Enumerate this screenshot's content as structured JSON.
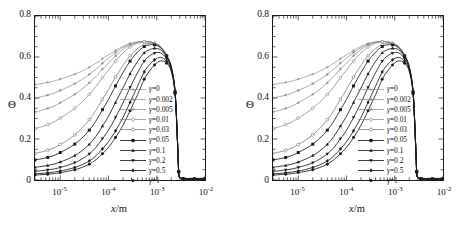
{
  "figure": {
    "panel_count": 2,
    "background": "#ffffff",
    "ink_color": "#1a1a1a"
  },
  "axes": {
    "ylabel": "Θ",
    "xlabel_var": "x",
    "xlabel_unit": "m",
    "xlabel": "x/m",
    "yticks": [
      "0",
      "0.2",
      "0.4",
      "0.6",
      "0.8"
    ],
    "ytick_values": [
      0,
      0.2,
      0.4,
      0.6,
      0.8
    ],
    "xticks": [
      "10⁻⁵",
      "10⁻⁴",
      "10⁻³",
      "10⁻²"
    ],
    "xtick_mantissa": "10",
    "xtick_exponents": [
      "-5",
      "-4",
      "-3",
      "-2"
    ],
    "xtick_values": [
      1e-05,
      0.0001,
      0.001,
      0.01
    ],
    "ylim": [
      0,
      0.8
    ],
    "xlim": [
      3e-06,
      0.01
    ],
    "xscale": "log",
    "yscale": "linear",
    "grid": "off"
  },
  "legend": {
    "position": "center-right-inside",
    "entries": [
      {
        "label": "γ=0",
        "gamma": 0,
        "marker": "plus",
        "color": "#8d8d8d"
      },
      {
        "label": "γ=0.002",
        "gamma": 0.002,
        "marker": "star",
        "color": "#8a8a8a"
      },
      {
        "label": "γ=0.005",
        "gamma": 0.005,
        "marker": "asterisk",
        "color": "#848484"
      },
      {
        "label": "γ=0.01",
        "gamma": 0.01,
        "marker": "circle-open",
        "color": "#7c7c7c"
      },
      {
        "label": "γ=0.03",
        "gamma": 0.03,
        "marker": "circle-open",
        "color": "#6e6e6e"
      },
      {
        "label": "γ=0.05",
        "gamma": 0.05,
        "marker": "square-filled",
        "color": "#1a1a1a"
      },
      {
        "label": "γ=0.1",
        "gamma": 0.1,
        "marker": "triangle-up",
        "color": "#1a1a1a"
      },
      {
        "label": "γ=0.2",
        "gamma": 0.2,
        "marker": "triangle-down",
        "color": "#1a1a1a"
      },
      {
        "label": "γ=0.5",
        "gamma": 0.5,
        "marker": "diamond",
        "color": "#1a1a1a"
      },
      {
        "label": "γ=1",
        "gamma": 1,
        "marker": "circle-filled",
        "color": "#1a1a1a"
      }
    ]
  },
  "chart_data": {
    "type": "line",
    "title": "",
    "xlabel": "x/m",
    "ylabel": "Θ",
    "xscale": "log",
    "xlim": [
      3e-06,
      0.01
    ],
    "ylim": [
      0,
      0.8
    ],
    "grid": "off",
    "legend_position": "center-right-inside",
    "x": [
      3e-06,
      4e-06,
      5.5e-06,
      7.5e-06,
      1e-05,
      1.4e-05,
      2e-05,
      2.8e-05,
      4e-05,
      5.5e-05,
      7.5e-05,
      0.0001,
      0.00014,
      0.0002,
      0.00028,
      0.0004,
      0.00055,
      0.0007,
      0.0009,
      0.0012,
      0.0016,
      0.002,
      0.0024,
      0.0027,
      0.00285,
      0.003,
      0.0035,
      0.0045,
      0.006,
      0.008,
      0.01
    ],
    "series": [
      {
        "name": "γ=0",
        "values": [
          0.465,
          0.47,
          0.476,
          0.483,
          0.492,
          0.503,
          0.516,
          0.531,
          0.55,
          0.57,
          0.592,
          0.61,
          0.632,
          0.652,
          0.666,
          0.674,
          0.676,
          0.674,
          0.667,
          0.65,
          0.608,
          0.552,
          0.43,
          0.18,
          0.04,
          0.012,
          0.006,
          0.005,
          0.005,
          0.005,
          0.005
        ]
      },
      {
        "name": "γ=0.002",
        "values": [
          0.4,
          0.406,
          0.414,
          0.424,
          0.437,
          0.452,
          0.47,
          0.49,
          0.515,
          0.541,
          0.57,
          0.594,
          0.622,
          0.646,
          0.663,
          0.673,
          0.676,
          0.674,
          0.667,
          0.65,
          0.608,
          0.552,
          0.43,
          0.18,
          0.04,
          0.012,
          0.006,
          0.005,
          0.005,
          0.005,
          0.005
        ]
      },
      {
        "name": "γ=0.005",
        "values": [
          0.332,
          0.339,
          0.349,
          0.361,
          0.377,
          0.396,
          0.418,
          0.443,
          0.474,
          0.506,
          0.541,
          0.571,
          0.606,
          0.637,
          0.658,
          0.671,
          0.675,
          0.674,
          0.667,
          0.65,
          0.608,
          0.552,
          0.43,
          0.18,
          0.04,
          0.012,
          0.006,
          0.005,
          0.005,
          0.005,
          0.005
        ]
      },
      {
        "name": "γ=0.01",
        "values": [
          0.252,
          0.259,
          0.27,
          0.284,
          0.302,
          0.324,
          0.35,
          0.38,
          0.417,
          0.456,
          0.499,
          0.536,
          0.58,
          0.62,
          0.649,
          0.667,
          0.674,
          0.673,
          0.667,
          0.65,
          0.608,
          0.552,
          0.43,
          0.18,
          0.04,
          0.012,
          0.006,
          0.005,
          0.005,
          0.005,
          0.005
        ]
      },
      {
        "name": "γ=0.03",
        "values": [
          0.13,
          0.136,
          0.145,
          0.157,
          0.173,
          0.194,
          0.22,
          0.252,
          0.294,
          0.34,
          0.394,
          0.442,
          0.502,
          0.559,
          0.606,
          0.641,
          0.661,
          0.666,
          0.664,
          0.648,
          0.607,
          0.551,
          0.43,
          0.18,
          0.04,
          0.012,
          0.006,
          0.005,
          0.005,
          0.005,
          0.005
        ]
      },
      {
        "name": "γ=0.05",
        "values": [
          0.098,
          0.103,
          0.11,
          0.12,
          0.134,
          0.152,
          0.175,
          0.204,
          0.243,
          0.288,
          0.343,
          0.393,
          0.459,
          0.524,
          0.58,
          0.624,
          0.651,
          0.659,
          0.659,
          0.645,
          0.605,
          0.55,
          0.429,
          0.18,
          0.04,
          0.012,
          0.006,
          0.005,
          0.005,
          0.005,
          0.005
        ]
      },
      {
        "name": "γ=0.1",
        "values": [
          0.062,
          0.066,
          0.071,
          0.078,
          0.088,
          0.101,
          0.119,
          0.142,
          0.174,
          0.213,
          0.263,
          0.311,
          0.378,
          0.449,
          0.518,
          0.578,
          0.62,
          0.635,
          0.642,
          0.635,
          0.6,
          0.547,
          0.428,
          0.179,
          0.04,
          0.012,
          0.006,
          0.005,
          0.005,
          0.005,
          0.005
        ]
      },
      {
        "name": "γ=0.2",
        "values": [
          0.042,
          0.045,
          0.049,
          0.054,
          0.061,
          0.071,
          0.084,
          0.102,
          0.127,
          0.159,
          0.201,
          0.243,
          0.305,
          0.376,
          0.451,
          0.523,
          0.58,
          0.604,
          0.619,
          0.62,
          0.592,
          0.542,
          0.426,
          0.179,
          0.04,
          0.012,
          0.006,
          0.005,
          0.005,
          0.005,
          0.005
        ]
      },
      {
        "name": "γ=0.5",
        "values": [
          0.03,
          0.032,
          0.035,
          0.039,
          0.044,
          0.051,
          0.061,
          0.074,
          0.093,
          0.118,
          0.152,
          0.187,
          0.24,
          0.305,
          0.379,
          0.457,
          0.527,
          0.561,
          0.586,
          0.598,
          0.58,
          0.535,
          0.423,
          0.178,
          0.04,
          0.012,
          0.006,
          0.005,
          0.005,
          0.005,
          0.005
        ]
      },
      {
        "name": "γ=1",
        "values": [
          0.024,
          0.026,
          0.028,
          0.031,
          0.036,
          0.042,
          0.05,
          0.061,
          0.077,
          0.099,
          0.128,
          0.159,
          0.207,
          0.267,
          0.338,
          0.416,
          0.491,
          0.53,
          0.561,
          0.581,
          0.57,
          0.529,
          0.42,
          0.178,
          0.04,
          0.012,
          0.006,
          0.005,
          0.005,
          0.005,
          0.005
        ]
      }
    ]
  }
}
